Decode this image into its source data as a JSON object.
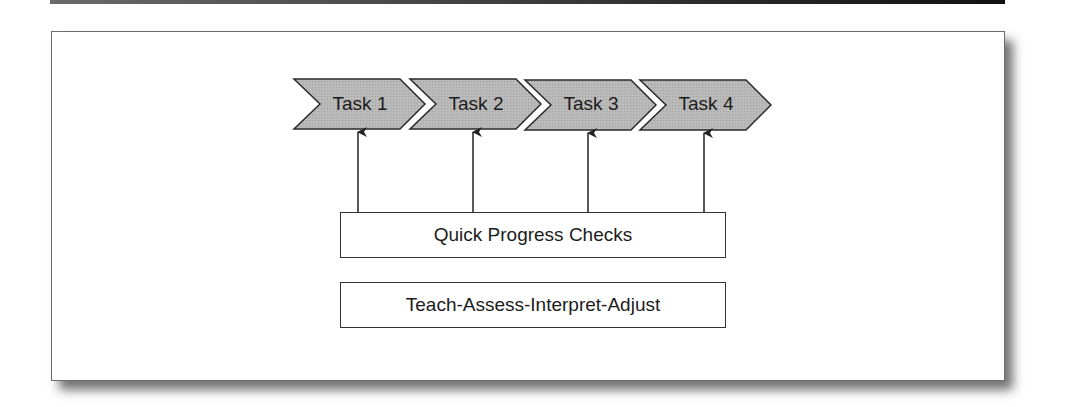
{
  "diagram": {
    "tasks": [
      {
        "label": "Task 1"
      },
      {
        "label": "Task 2"
      },
      {
        "label": "Task 3"
      },
      {
        "label": "Task 4"
      }
    ],
    "progress_box": {
      "label": "Quick Progress Checks"
    },
    "cycle_box": {
      "label": "Teach-Assess-Interpret-Adjust"
    },
    "colors": {
      "chevron_fill": "#b3b3b3",
      "stroke": "#2a2a2a",
      "frame_border": "#6d6d6d"
    },
    "relationships": [
      {
        "from": "Quick Progress Checks",
        "to": "Task 1"
      },
      {
        "from": "Quick Progress Checks",
        "to": "Task 2"
      },
      {
        "from": "Quick Progress Checks",
        "to": "Task 3"
      },
      {
        "from": "Quick Progress Checks",
        "to": "Task 4"
      }
    ]
  }
}
